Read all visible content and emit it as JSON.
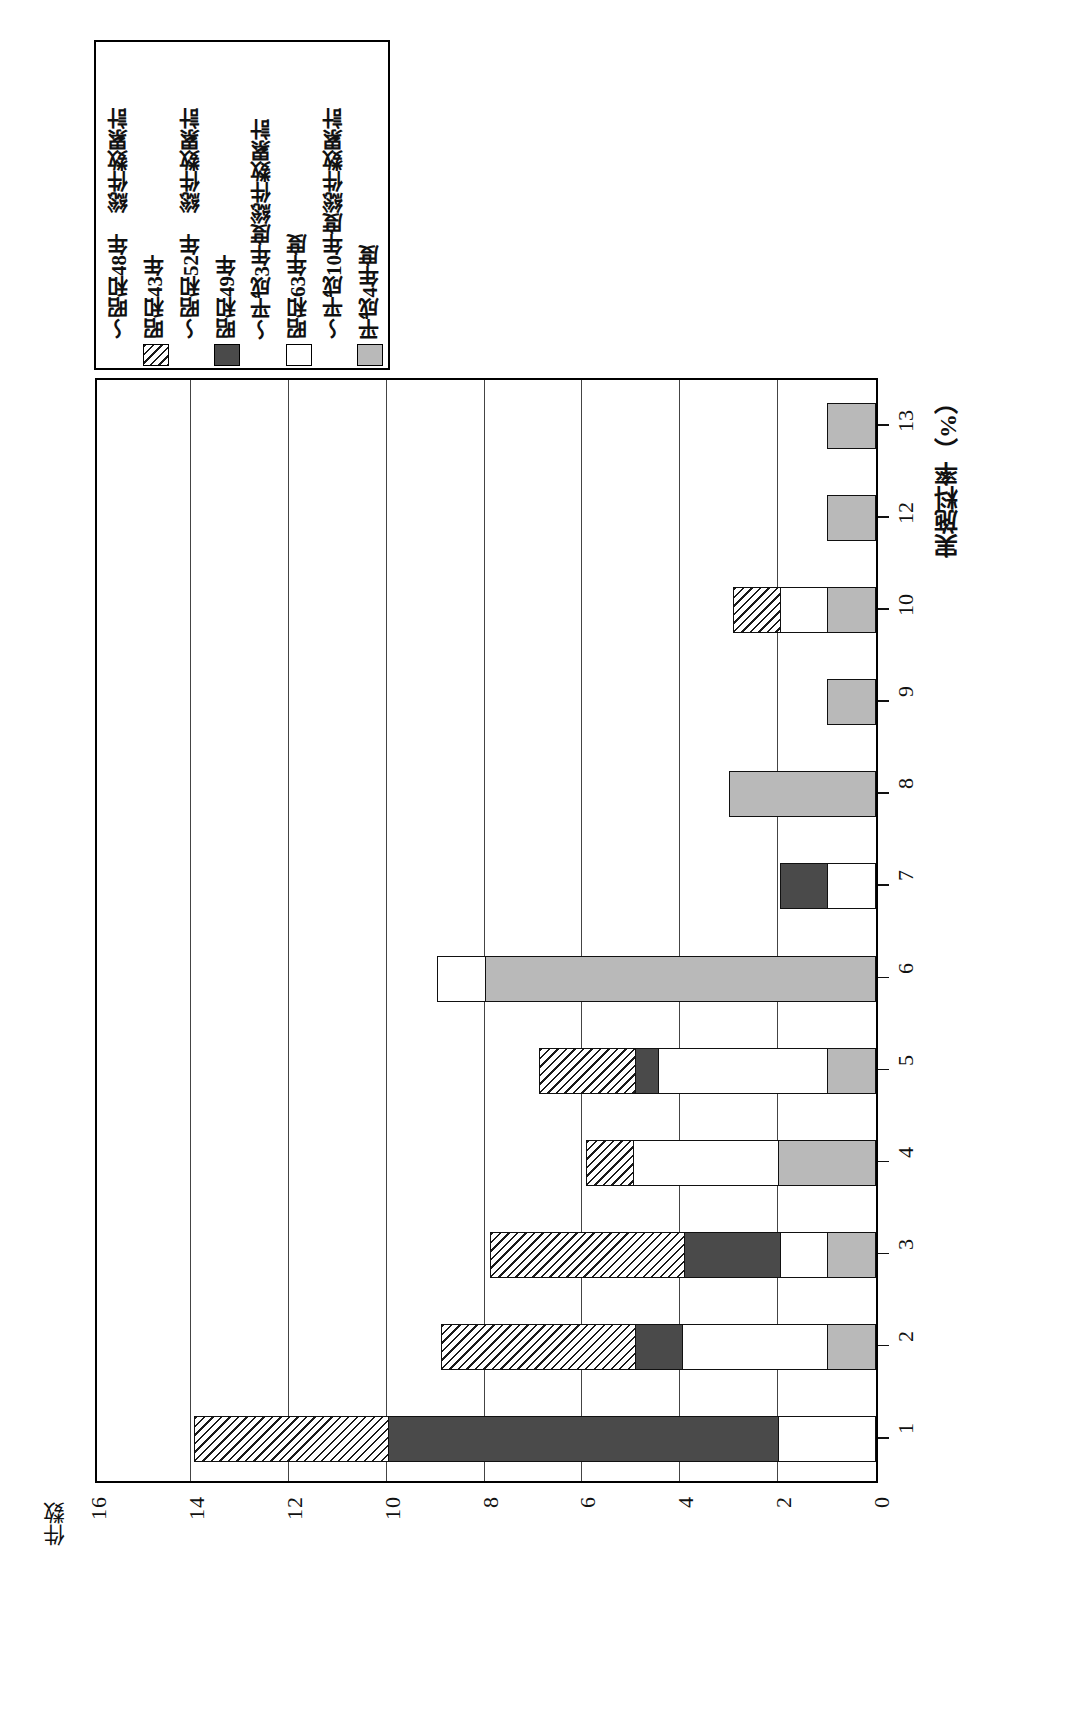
{
  "chart_data": {
    "type": "bar",
    "orientation": "horizontal",
    "title": "図2－27－2　ゴム製品（イニシャル　無）の実施料率別契約件数",
    "xlabel": "実施料率（%）",
    "ylabel": "件数",
    "categories": [
      "1",
      "2",
      "3",
      "4",
      "5",
      "6",
      "7",
      "8",
      "9",
      "10",
      "12",
      "13"
    ],
    "value_ticks": [
      "16",
      "14",
      "12",
      "10",
      "8",
      "6",
      "4",
      "2",
      "0"
    ],
    "vlim": [
      0,
      16
    ],
    "grid": true,
    "legend_position": "top-left",
    "series": [
      {
        "name": "平成4年度 ～平成10年度総件数累計",
        "key": "heisei4_10",
        "fill": "gray",
        "values": [
          0,
          1,
          1,
          2,
          1,
          8,
          0,
          3,
          1,
          1,
          1,
          1
        ]
      },
      {
        "name": "昭和63年度 ～平成3年度総件数累計",
        "key": "showa63_heisei3",
        "fill": "white",
        "values": [
          2,
          3,
          1,
          3,
          3.5,
          1,
          1,
          0,
          0,
          1,
          0,
          0
        ]
      },
      {
        "name": "昭和49年 ～昭和52年 総件数累計",
        "key": "showa49_52",
        "fill": "dark",
        "values": [
          8,
          1,
          2,
          0,
          0.5,
          0,
          1,
          0,
          0,
          0,
          0,
          0
        ]
      },
      {
        "name": "昭和43年 ～昭和48年 総件数累計",
        "key": "showa43_48",
        "fill": "hatch",
        "values": [
          4,
          4,
          4,
          1,
          2,
          0,
          0,
          0,
          0,
          1,
          0,
          0
        ]
      }
    ],
    "totals": [
      14,
      9,
      8,
      6,
      7,
      9,
      2,
      3,
      1,
      3,
      1,
      1
    ]
  },
  "legend": {
    "items": [
      {
        "label": "平成4年度",
        "fill": "gray",
        "tilde": false
      },
      {
        "label": "～平成10年度総件数累計",
        "fill": "none",
        "tilde": true
      },
      {
        "label": "昭和63年度",
        "fill": "white",
        "tilde": false
      },
      {
        "label": "～平成3年度総件数累計",
        "fill": "none",
        "tilde": true
      },
      {
        "label": "昭和49年",
        "fill": "dark",
        "tilde": false
      },
      {
        "label": "～昭和52年　総件数累計",
        "fill": "none",
        "tilde": true
      },
      {
        "label": "昭和43年",
        "fill": "hatch",
        "tilde": false
      },
      {
        "label": "～昭和48年　総件数累計",
        "fill": "none",
        "tilde": true
      }
    ]
  },
  "colors": {
    "gray": "#b9b9b9",
    "white": "#ffffff",
    "dark": "#4a4a4a",
    "outline": "#111111",
    "grid": "#444444"
  }
}
